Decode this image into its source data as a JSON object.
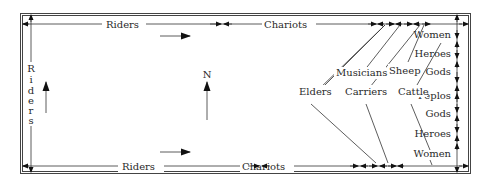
{
  "diagram": {
    "type": "procession-plan",
    "colors": {
      "ink": "#222222",
      "background": "#ffffff"
    },
    "compass": {
      "label": "N"
    },
    "top_edge": {
      "labels": [
        "Riders",
        "Chariots"
      ]
    },
    "bottom_edge": {
      "labels": [
        "Riders",
        "Chariots"
      ]
    },
    "left_edge": {
      "label_letters": [
        "R",
        "i",
        "d",
        "e",
        "r",
        "s"
      ],
      "label": "Riders"
    },
    "right_edge": {
      "labels": [
        "Women",
        "Heroes",
        "Gods",
        "Peplos",
        "Gods",
        "Heroes",
        "Women"
      ]
    },
    "inner_labels": {
      "musicians": "Musicians",
      "sheep": "Sheep",
      "elders": "Elders",
      "carriers": "Carriers",
      "cattle": "Cattle"
    },
    "direction_arrows": [
      "east-top",
      "east-bottom",
      "north-left",
      "north-center"
    ]
  }
}
